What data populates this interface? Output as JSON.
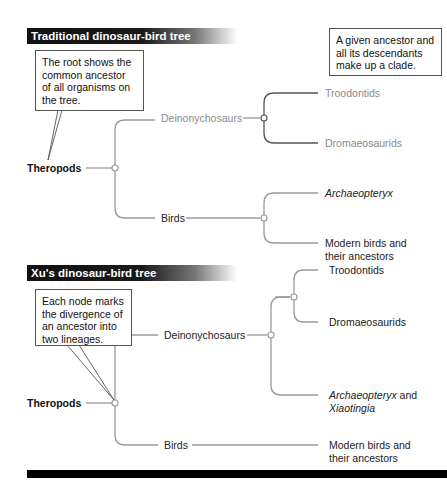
{
  "top_tree": {
    "title": "Traditional dinosaur-bird tree",
    "callout": "The root shows the common ancestor of all organisms on the tree.",
    "clade_note": "A given ancestor and all its descendants make up a clade.",
    "root": "Theropods",
    "branch_a": "Deinonychosaurs",
    "branch_b": "Birds",
    "leaves": {
      "troodontids": "Troodontids",
      "dromaeosaurids": "Dromaeosaurids",
      "archaeopteryx": "Archaeopteryx",
      "modern_birds_line1": "Modern birds and",
      "modern_birds_line2": "their ancestors"
    }
  },
  "bottom_tree": {
    "title": "Xu's dinosaur-bird tree",
    "callout": "Each node marks the divergence of an ancestor into two lineages.",
    "root": "Theropods",
    "branch_a": "Deinonychosaurs",
    "branch_b": "Birds",
    "leaves": {
      "troodontids": "Troodontids",
      "dromaeosaurids": "Dromaeosaurids",
      "archaeopteryx": "Archaeopteryx",
      "archaeopteryx_and": " and",
      "xiaotingia": "Xiaotingia",
      "modern_birds_line1": "Modern birds and",
      "modern_birds_line2": "their ancestors"
    }
  },
  "colors": {
    "line": "#9a9a9a",
    "clade_line": "#555555",
    "header_bg": "#111111",
    "header_text": "#ffffff",
    "gray_label": "#8a8a8a"
  }
}
